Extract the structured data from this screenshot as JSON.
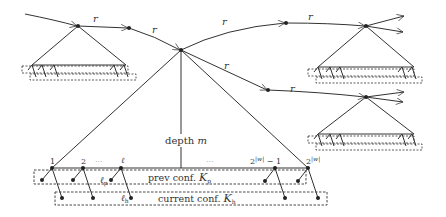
{
  "diagram": {
    "edge_label": "r",
    "depth_label": "depth",
    "depth_var": "m",
    "leaf_labels": {
      "first": "1",
      "second": "2",
      "ellipsis": "···",
      "ell": "ℓ",
      "second_last": "2",
      "second_last_exp": "|w|",
      "second_last_suffix": " − 1",
      "last": "2",
      "last_exp": "|w|"
    },
    "ell_p": "ℓ",
    "ell_p_sub": "p",
    "ell_h": "ℓ",
    "ell_h_sub": "h",
    "prev_conf": {
      "text": "prev conf. ",
      "var": "K",
      "sub": "p"
    },
    "current_conf": {
      "text": "current conf. ",
      "var": "K",
      "sub": "h"
    },
    "colors": {
      "line": "#333333",
      "dash": "#444444",
      "background": "#ffffff"
    }
  }
}
